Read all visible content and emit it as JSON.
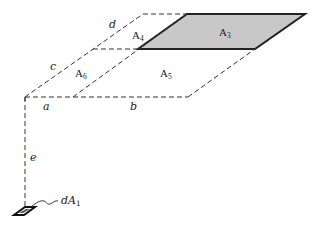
{
  "diagram": {
    "colors": {
      "line": "#222222",
      "shade": "#c8c8c8",
      "background": "#ffffff"
    },
    "dimension_labels": {
      "a": "a",
      "b": "b",
      "c": "c",
      "d": "d",
      "e": "e"
    },
    "area_labels": {
      "A3": {
        "base": "A",
        "sub": "3"
      },
      "A4": {
        "base": "A",
        "sub": "4"
      },
      "A5": {
        "base": "A",
        "sub": "5"
      },
      "A6": {
        "base": "A",
        "sub": "6"
      }
    },
    "element_label": {
      "prefix": "d",
      "base": "A",
      "sub": "1"
    }
  }
}
